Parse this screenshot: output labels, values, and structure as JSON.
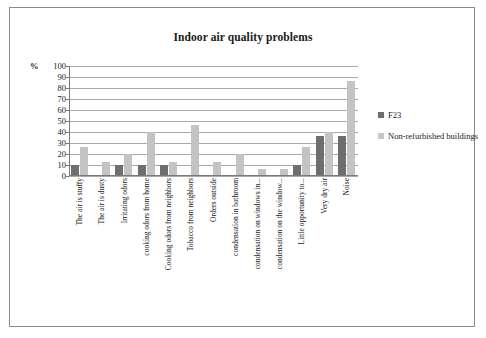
{
  "frame": {
    "border_color": "#8a8a8a"
  },
  "chart_data": {
    "type": "bar",
    "title": "Indoor air quality problems",
    "xlabel": "",
    "ylabel": "%",
    "ylim": [
      0,
      100
    ],
    "ytick_step": 10,
    "yticks": [
      100,
      90,
      80,
      70,
      60,
      50,
      40,
      30,
      20,
      10,
      0
    ],
    "grid": true,
    "legend_position": "right",
    "categories": [
      "The air is stuffy",
      "The air is dusty",
      "Irritating odors",
      "cooking odors from home",
      "Cooking odors from neighbors",
      "Tobacco from neighbors",
      "Orders outside",
      "condensation in bathroom",
      "condensation on windows in...",
      "condensation on the window...",
      "Little opportunity to...",
      "Very dry air",
      "Noise"
    ],
    "series": [
      {
        "name": "F23",
        "color": "#6e6e6e",
        "values": [
          10,
          0,
          10,
          10,
          10,
          0,
          0,
          0,
          0,
          0,
          10,
          36,
          36
        ]
      },
      {
        "name": "Non-refurbished buildings",
        "color": "#c4c4c4",
        "values": [
          26,
          13,
          20,
          40,
          13,
          46,
          13,
          20,
          6,
          6,
          26,
          40,
          86
        ]
      }
    ]
  },
  "legend": {
    "items": [
      {
        "label": "F23",
        "color": "#6e6e6e"
      },
      {
        "label": "Non-refurbished buildings",
        "color": "#c4c4c4"
      }
    ]
  }
}
